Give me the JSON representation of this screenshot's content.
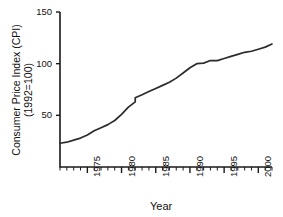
{
  "figure": {
    "title_remnant": "",
    "axis_color": "#1a1a1a",
    "line_color": "#2b2b2b",
    "background": "#ffffff"
  },
  "chart_data": {
    "type": "line",
    "title": "",
    "subtitle": "",
    "xlabel": "Year",
    "ylabel": "Consumer Price Index (CPI)",
    "ylabel_line2": "(1992=100)",
    "xlim": [
      1971,
      2002
    ],
    "ylim": [
      0,
      150
    ],
    "yticks": [
      50,
      100,
      150
    ],
    "ytick_labels": [
      "50",
      "100",
      "150"
    ],
    "xticks": [
      1975,
      1980,
      1985,
      1990,
      1995,
      2000
    ],
    "xtick_labels": [
      "1975",
      "1980",
      "1985",
      "1990",
      "1995",
      "2000"
    ],
    "minor_xtick_interval": 1,
    "grid": false,
    "legend": false,
    "legend_position": "none",
    "annotations": [
      {
        "label": "series break / step increase",
        "x": 1982,
        "y_before": 63,
        "y_after": 67
      }
    ],
    "series": [
      {
        "name": "Consumer Price Index (CPI)",
        "x": [
          1971,
          1972,
          1973,
          1974,
          1975,
          1976,
          1977,
          1978,
          1979,
          1980,
          1981,
          1982,
          1982,
          1983,
          1984,
          1985,
          1986,
          1987,
          1988,
          1989,
          1990,
          1991,
          1992,
          1993,
          1994,
          1995,
          1996,
          1997,
          1998,
          1999,
          2000,
          2001,
          2002
        ],
        "values": [
          23,
          24,
          26,
          28,
          31,
          35,
          38,
          41,
          45,
          51,
          58,
          63,
          67,
          70,
          73,
          76,
          79,
          82,
          86,
          91,
          96,
          100,
          100.5,
          103,
          103,
          105,
          107,
          109,
          111,
          112,
          114,
          116,
          119
        ]
      }
    ]
  },
  "y_axis": {
    "ticks": [
      {
        "label": "150",
        "value": 150
      },
      {
        "label": "100",
        "value": 100
      },
      {
        "label": "50",
        "value": 50
      }
    ]
  },
  "x_axis": {
    "title": "Year",
    "ticks": [
      {
        "label": "1975",
        "value": 1975
      },
      {
        "label": "1980",
        "value": 1980
      },
      {
        "label": "1985",
        "value": 1985
      },
      {
        "label": "1990",
        "value": 1990
      },
      {
        "label": "1995",
        "value": 1995
      },
      {
        "label": "2000",
        "value": 2000
      }
    ]
  }
}
